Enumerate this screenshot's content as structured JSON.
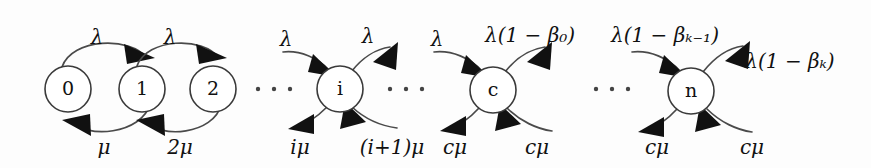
{
  "diagram": {
    "type": "state-transition-diagram",
    "background_color": "#fdfdfd",
    "stroke_color": "#3a3a3a",
    "arrow_color": "#111111",
    "nodes": [
      {
        "id": "s0",
        "label": "0",
        "cx": 68,
        "cy": 89,
        "r": 23
      },
      {
        "id": "s1",
        "label": "1",
        "cx": 142,
        "cy": 89,
        "r": 23
      },
      {
        "id": "s2",
        "label": "2",
        "cx": 213,
        "cy": 89,
        "r": 23
      },
      {
        "id": "si",
        "label": "i",
        "cx": 340,
        "cy": 89,
        "r": 23
      },
      {
        "id": "sc",
        "label": "c",
        "cx": 493,
        "cy": 90,
        "r": 23
      },
      {
        "id": "sn",
        "label": "n",
        "cx": 691,
        "cy": 91,
        "r": 23
      }
    ],
    "ellipses": [
      {
        "id": "e1",
        "cx": 274,
        "cy": 89,
        "dots": 3
      },
      {
        "id": "e2",
        "cx": 406,
        "cy": 89,
        "dots": 3
      },
      {
        "id": "e3",
        "cx": 612,
        "cy": 89,
        "dots": 3
      }
    ],
    "arrival_labels": [
      {
        "id": "a0",
        "text": "λ",
        "x": 97,
        "y": 38
      },
      {
        "id": "a1",
        "text": "λ",
        "x": 170,
        "y": 38
      },
      {
        "id": "a2",
        "text": "λ",
        "x": 286,
        "y": 40
      },
      {
        "id": "a3",
        "text": "λ",
        "x": 368,
        "y": 37
      },
      {
        "id": "a4",
        "text": "λ",
        "x": 437,
        "y": 40
      },
      {
        "id": "a5",
        "text": "λ(1 − β₀)",
        "x": 530,
        "y": 36
      },
      {
        "id": "a6",
        "text": "λ(1 − βₖ₋₁)",
        "x": 665,
        "y": 36
      },
      {
        "id": "a7",
        "text": "λ(1 − βₖ)",
        "x": 790,
        "y": 62
      }
    ],
    "service_labels": [
      {
        "id": "b0",
        "text": "μ",
        "x": 104,
        "y": 148
      },
      {
        "id": "b1",
        "text": "2μ",
        "x": 180,
        "y": 148
      },
      {
        "id": "b2",
        "text": "iμ",
        "x": 300,
        "y": 148
      },
      {
        "id": "b3",
        "text": "(i+1)μ",
        "x": 392,
        "y": 148
      },
      {
        "id": "b4",
        "text": "cμ",
        "x": 455,
        "y": 148
      },
      {
        "id": "b5",
        "text": "cμ",
        "x": 537,
        "y": 148
      },
      {
        "id": "b6",
        "text": "cμ",
        "x": 657,
        "y": 148
      },
      {
        "id": "b7",
        "text": "cμ",
        "x": 752,
        "y": 148
      }
    ],
    "transitions": [
      {
        "from": "0",
        "to": "1",
        "rate": "λ",
        "direction": "forward"
      },
      {
        "from": "1",
        "to": "2",
        "rate": "λ",
        "direction": "forward"
      },
      {
        "from": "1",
        "to": "0",
        "rate": "μ",
        "direction": "backward"
      },
      {
        "from": "2",
        "to": "1",
        "rate": "2μ",
        "direction": "backward"
      },
      {
        "from": "i-1",
        "to": "i",
        "rate": "λ",
        "direction": "forward"
      },
      {
        "from": "i",
        "to": "i+1",
        "rate": "λ",
        "direction": "forward"
      },
      {
        "from": "i",
        "to": "i-1",
        "rate": "iμ",
        "direction": "backward"
      },
      {
        "from": "i+1",
        "to": "i",
        "rate": "(i+1)μ",
        "direction": "backward"
      },
      {
        "from": "c-1",
        "to": "c",
        "rate": "λ",
        "direction": "forward"
      },
      {
        "from": "c",
        "to": "c+1",
        "rate": "λ(1 − β₀)",
        "direction": "forward"
      },
      {
        "from": "c",
        "to": "c-1",
        "rate": "cμ",
        "direction": "backward"
      },
      {
        "from": "c+1",
        "to": "c",
        "rate": "cμ",
        "direction": "backward"
      },
      {
        "from": "n-1",
        "to": "n",
        "rate": "λ(1 − βₖ₋₁)",
        "direction": "forward"
      },
      {
        "from": "n",
        "to": "n+1",
        "rate": "λ(1 − βₖ)",
        "direction": "forward"
      },
      {
        "from": "n",
        "to": "n-1",
        "rate": "cμ",
        "direction": "backward"
      },
      {
        "from": "n+1",
        "to": "n",
        "rate": "cμ",
        "direction": "backward"
      }
    ]
  }
}
